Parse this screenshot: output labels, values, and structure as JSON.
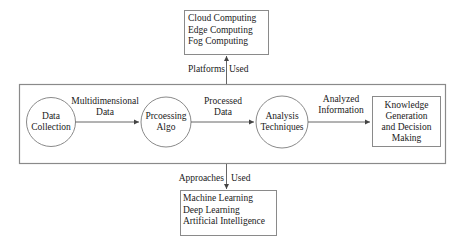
{
  "platforms": {
    "items": [
      "Cloud Computing",
      "Edge Computing",
      "Fog Computing"
    ],
    "label_left": "Platforms",
    "label_right": "Used"
  },
  "approaches": {
    "items": [
      "Machine Learning",
      "Deep Learning",
      "Artificial Intelligence"
    ],
    "label_left": "Approaches",
    "label_right": "Used"
  },
  "nodes": {
    "data_collection": [
      "Data",
      "Collection"
    ],
    "processing_algo": [
      "Prcoessing",
      "Algo"
    ],
    "analysis_techniques": [
      "Analysis",
      "Techniques"
    ],
    "knowledge": [
      "Knowledge",
      "Generation",
      "and Decision",
      "Making"
    ]
  },
  "edges": {
    "multidimensional_data": [
      "Multidimensional",
      "Data"
    ],
    "processed_data": [
      "Processed",
      "Data"
    ],
    "analyzed_information": [
      "Analyzed",
      "Information"
    ]
  },
  "colors": {
    "stroke": "#8a8a8a",
    "arrow": "#555555",
    "text": "#1a1a1a"
  }
}
